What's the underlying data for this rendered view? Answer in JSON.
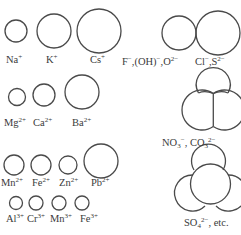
{
  "stroke_color": "#4a4a4a",
  "ions": {
    "na": {
      "base": "Na",
      "charge": "+"
    },
    "k": {
      "base": "K",
      "charge": "+"
    },
    "cs": {
      "base": "Cs",
      "charge": "+"
    },
    "f": {
      "text": "F",
      "charge": "−",
      "sep1": ",(OH)",
      "oh_charge": "−",
      "sep2": ",O",
      "o_charge": "2−"
    },
    "cl": {
      "base": "Cl",
      "charge": "−",
      "sep": ",S",
      "s_charge": "2−"
    },
    "mg": {
      "base": "Mg",
      "charge": "2+"
    },
    "ca": {
      "base": "Ca",
      "charge": "2+"
    },
    "ba": {
      "base": "Ba",
      "charge": "2+"
    },
    "no3": {
      "base": "NO",
      "sub": "3",
      "charge": "−",
      "sep": ", CO",
      "sub2": "3",
      "charge2": "2−"
    },
    "mn2": {
      "base": "Mn",
      "charge": "2+"
    },
    "fe2": {
      "base": "Fe",
      "charge": "2+"
    },
    "zn": {
      "base": "Zn",
      "charge": "2+"
    },
    "pb": {
      "base": "Pb",
      "charge": "2+"
    },
    "al": {
      "base": "Al",
      "charge": "3+"
    },
    "cr": {
      "base": "Cr",
      "charge": "3+"
    },
    "mn3": {
      "base": "Mn",
      "charge": "3+"
    },
    "fe3": {
      "base": "Fe",
      "charge": "3+"
    },
    "so4": {
      "base": "SO",
      "sub": "4",
      "charge": "2−",
      "suffix": ", etc."
    }
  }
}
